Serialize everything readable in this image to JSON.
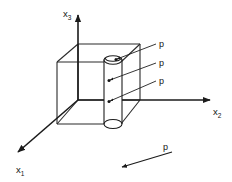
{
  "figure": {
    "title": "",
    "background_color": "#ffffff",
    "line_color": "#1b1b1b"
  },
  "axes": {
    "origin_label": "",
    "items": [
      {
        "id": "x3",
        "base": "x",
        "subscript": "3",
        "direction": "up"
      },
      {
        "id": "x2",
        "base": "x",
        "subscript": "2",
        "direction": "right"
      },
      {
        "id": "x1",
        "base": "x",
        "subscript": "1",
        "direction": "down-left"
      }
    ]
  },
  "annotations": {
    "pressure_symbol": "p",
    "leader_labels": [
      "p",
      "p",
      "p"
    ],
    "direction_arrow_label": "p"
  },
  "geometry": {
    "shape_outer": "cube",
    "shape_inner": "cylinder"
  }
}
